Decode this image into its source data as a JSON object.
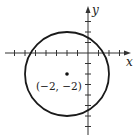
{
  "figure": {
    "x_axis_label": "x",
    "y_axis_label": "y",
    "center_label": "(−2, −2)",
    "colors": {
      "stroke": "#1a1a1a",
      "axis": "#333333",
      "background": "#ffffff"
    }
  },
  "math": {
    "type": "circle",
    "center": [
      -2,
      -2
    ],
    "radius": 4,
    "equation": "(x + 2)^2 + (y + 2)^2 = 16",
    "x_ticks": [
      -7,
      -6,
      -5,
      -4,
      -3,
      -2,
      -1,
      1,
      2,
      3
    ],
    "y_ticks": [
      3,
      2,
      1,
      -1,
      -2,
      -3,
      -4,
      -5,
      -6,
      -7
    ],
    "unit_px": 10.5,
    "origin_px": [
      88,
      53
    ]
  }
}
